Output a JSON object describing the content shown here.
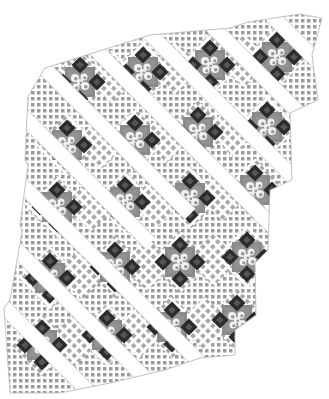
{
  "image": {
    "subject": "Diagonal-set quilt layout with floral center blocks and white sashing strips",
    "width": 329,
    "height": 399
  },
  "caption": {
    "text": ""
  },
  "colors": {
    "background": "#ffffff",
    "sashing": "#ffffff",
    "sashing_edge": "#cfcfcf",
    "block_center": "#8a8a8a",
    "block_center_light": "#9a9a9a",
    "floral_motif": "#f2f2f2",
    "floral_shadow": "#5a5a5a",
    "corner_dark": "#2b2b2b",
    "corner_dark_inner": "#555555",
    "diag_check_dark": "#a8a8a8",
    "diag_check_light": "#d9d9d9",
    "edge_check_dark": "#9c9c9c",
    "edge_check_light": "#d0d0d0",
    "outline": "#b5b5b5"
  },
  "quilt": {
    "block_size": 30,
    "corner_size": 11,
    "sash_width": 14,
    "block_rows": [
      [
        [
          80,
          82
        ],
        [
          143,
          72
        ],
        [
          210,
          65
        ],
        [
          277,
          57
        ]
      ],
      [
        [
          67,
          145
        ],
        [
          135,
          140
        ],
        [
          198,
          132
        ],
        [
          267,
          127
        ]
      ],
      [
        [
          57,
          207
        ],
        [
          125,
          202
        ],
        [
          190,
          198
        ],
        [
          255,
          190
        ]
      ],
      [
        [
          50,
          278
        ],
        [
          115,
          267
        ],
        [
          180,
          262
        ],
        [
          247,
          257
        ]
      ],
      [
        [
          42,
          345
        ],
        [
          107,
          335
        ],
        [
          172,
          327
        ],
        [
          237,
          320
        ]
      ]
    ],
    "sashing_lines": [
      [
        [
          20,
          44
        ],
        [
          190,
          214
        ]
      ],
      [
        [
          40,
          -6
        ],
        [
          330,
          284
        ]
      ],
      [
        [
          110,
          -6
        ],
        [
          330,
          214
        ]
      ],
      [
        [
          180,
          -6
        ],
        [
          330,
          144
        ]
      ],
      [
        [
          250,
          -6
        ],
        [
          330,
          74
        ]
      ],
      [
        [
          0,
          93
        ],
        [
          150,
          243
        ]
      ],
      [
        [
          0,
          163
        ],
        [
          230,
          393
        ]
      ],
      [
        [
          0,
          233
        ],
        [
          160,
          393
        ]
      ],
      [
        [
          0,
          303
        ],
        [
          90,
          393
        ]
      ]
    ],
    "outline_polygon": [
      [
        150,
        35
      ],
      [
        230,
        28
      ],
      [
        248,
        22
      ],
      [
        300,
        14
      ],
      [
        322,
        18
      ],
      [
        315,
        44
      ],
      [
        312,
        55
      ],
      [
        318,
        100
      ],
      [
        290,
        113
      ],
      [
        292,
        180
      ],
      [
        270,
        190
      ],
      [
        268,
        250
      ],
      [
        255,
        263
      ],
      [
        256,
        315
      ],
      [
        235,
        330
      ],
      [
        235,
        355
      ],
      [
        200,
        358
      ],
      [
        165,
        370
      ],
      [
        110,
        383
      ],
      [
        60,
        393
      ],
      [
        10,
        393
      ],
      [
        4,
        308
      ],
      [
        10,
        300
      ],
      [
        22,
        232
      ],
      [
        20,
        225
      ],
      [
        28,
        165
      ],
      [
        25,
        160
      ],
      [
        28,
        96
      ],
      [
        45,
        68
      ],
      [
        150,
        35
      ]
    ]
  }
}
